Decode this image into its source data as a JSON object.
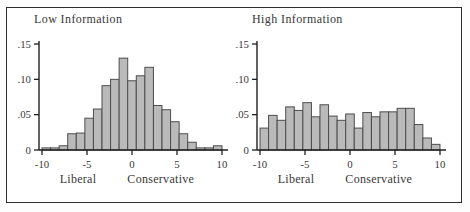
{
  "figure": {
    "background": "#ffffff",
    "frame_color": "#2d2d2d",
    "bar_fill": "#bababa",
    "bar_stroke": "#4d4d4d",
    "axis_color": "#1f1f1f",
    "text_color": "#383838"
  },
  "chart_data": [
    {
      "type": "bar",
      "title": "Low Information",
      "xlabel_left": "Liberal",
      "xlabel_right": "Conservative",
      "xlim": [
        -10,
        10
      ],
      "ylim": [
        0,
        0.15
      ],
      "grid": false,
      "legend": null,
      "xticks": [
        -10,
        -5,
        0,
        5,
        10
      ],
      "xtick_labels": [
        "-10",
        "-5",
        "0",
        "5",
        "10"
      ],
      "ytick_values": [
        0,
        0.05,
        0.1,
        0.15
      ],
      "ytick_labels": [
        "0",
        ".05",
        ".10",
        ".15"
      ],
      "bin_count": 21,
      "values": [
        0.003,
        0.003,
        0.006,
        0.023,
        0.024,
        0.045,
        0.058,
        0.091,
        0.1,
        0.13,
        0.098,
        0.105,
        0.117,
        0.063,
        0.057,
        0.04,
        0.023,
        0.011,
        0.003,
        0.003,
        0.006
      ]
    },
    {
      "type": "bar",
      "title": "High Information",
      "xlabel_left": "Liberal",
      "xlabel_right": "Conservative",
      "xlim": [
        -10,
        10
      ],
      "ylim": [
        0,
        0.15
      ],
      "grid": false,
      "legend": null,
      "xticks": [
        -10,
        -5,
        0,
        5,
        10
      ],
      "xtick_labels": [
        "-10",
        "-5",
        "0",
        "5",
        "10"
      ],
      "ytick_values": [
        0,
        0.05,
        0.1,
        0.15
      ],
      "ytick_labels": [
        "0",
        ".05",
        ".10",
        ".15"
      ],
      "bin_count": 21,
      "values": [
        0.031,
        0.049,
        0.042,
        0.061,
        0.056,
        0.067,
        0.047,
        0.064,
        0.048,
        0.042,
        0.051,
        0.031,
        0.053,
        0.047,
        0.054,
        0.054,
        0.059,
        0.059,
        0.036,
        0.017,
        0.008
      ]
    }
  ]
}
